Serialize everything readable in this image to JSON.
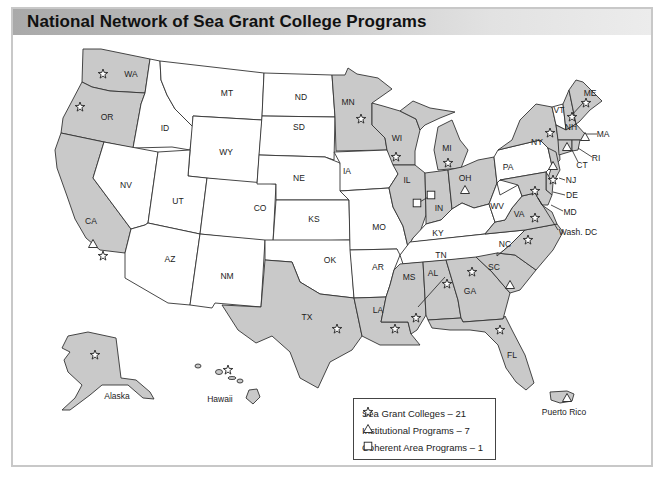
{
  "title": "National Network of Sea Grant College Programs",
  "colors": {
    "participating_state_fill": "#c9c9c9",
    "non_participating_state_fill": "#ffffff",
    "border": "#333333",
    "title_bar_gradient": [
      "#a9a9a9",
      "#ececec"
    ]
  },
  "legend": {
    "items": [
      {
        "icon": "star-icon",
        "label": "Sea Grant Colleges – 21"
      },
      {
        "icon": "triangle-icon",
        "label": "Institutional Programs – 7"
      },
      {
        "icon": "square-icon",
        "label": "Coherent Area Programs – 1"
      }
    ]
  },
  "states": {
    "shaded": [
      "WA",
      "OR",
      "CA",
      "MN",
      "WI",
      "MI",
      "IL",
      "IN",
      "OH",
      "NY",
      "VT",
      "NH",
      "ME",
      "MA",
      "RI",
      "CT",
      "NJ",
      "DE",
      "MD",
      "VA",
      "NC",
      "SC",
      "GA",
      "FL",
      "AL",
      "MS",
      "LA",
      "TX",
      "Alaska",
      "Hawaii",
      "Puerto Rico"
    ],
    "unshaded": [
      "ID",
      "MT",
      "NV",
      "UT",
      "WY",
      "CO",
      "AZ",
      "NM",
      "ND",
      "SD",
      "NE",
      "KS",
      "OK",
      "IA",
      "MO",
      "AR",
      "KY",
      "TN",
      "WV",
      "PA"
    ]
  },
  "labels": {
    "WA": "WA",
    "OR": "OR",
    "CA": "CA",
    "ID": "ID",
    "NV": "NV",
    "MT": "MT",
    "WY": "WY",
    "UT": "UT",
    "CO": "CO",
    "AZ": "AZ",
    "NM": "NM",
    "ND": "ND",
    "SD": "SD",
    "NE": "NE",
    "KS": "KS",
    "OK": "OK",
    "TX": "TX",
    "MN": "MN",
    "IA": "IA",
    "MO": "MO",
    "AR": "AR",
    "LA": "LA",
    "WI": "WI",
    "IL": "IL",
    "MI": "MI",
    "IN": "IN",
    "OH": "OH",
    "KY": "KY",
    "TN": "TN",
    "MS": "MS",
    "AL": "AL",
    "GA": "GA",
    "FL": "FL",
    "SC": "SC",
    "NC": "NC",
    "VA": "VA",
    "WV": "WV",
    "PA": "PA",
    "NY": "NY",
    "VT": "VT",
    "NH": "NH",
    "ME": "ME",
    "MA": "MA",
    "RI": "RI",
    "CT": "CT",
    "NJ": "NJ",
    "DE": "DE",
    "MD": "MD",
    "DC": "Wash. DC",
    "AK": "Alaska",
    "HI": "Hawaii",
    "PR": "Puerto Rico"
  }
}
